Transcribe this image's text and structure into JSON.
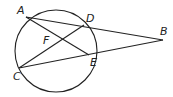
{
  "diagram": {
    "type": "geometry",
    "circle": {
      "cx": 56,
      "cy": 51,
      "r": 41
    },
    "points": {
      "A": {
        "x": 26,
        "y": 17,
        "lx": 17,
        "ly": 14
      },
      "D": {
        "x": 84,
        "y": 25,
        "lx": 86,
        "ly": 22
      },
      "E": {
        "x": 89,
        "y": 55,
        "lx": 90,
        "ly": 66
      },
      "C": {
        "x": 19,
        "y": 68,
        "lx": 13,
        "ly": 80
      },
      "B": {
        "x": 163,
        "y": 40,
        "lx": 160,
        "ly": 35
      },
      "F": {
        "lx": 43,
        "ly": 44
      }
    },
    "labels": {
      "A": "A",
      "B": "B",
      "C": "C",
      "D": "D",
      "E": "E",
      "F": "F"
    },
    "segments": [
      [
        "A",
        "B"
      ],
      [
        "C",
        "B"
      ],
      [
        "A",
        "E"
      ],
      [
        "C",
        "D"
      ]
    ]
  }
}
